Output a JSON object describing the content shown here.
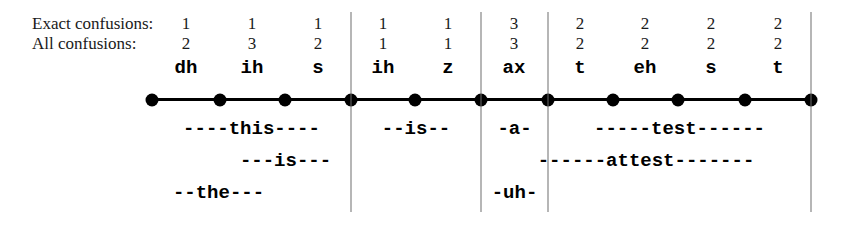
{
  "figure": {
    "kind": "phoneme-alignment-lattice",
    "width": 848,
    "height": 232,
    "background_color": "#ffffff",
    "axis_color": "#000000",
    "divider_color": "#6e6e6e"
  },
  "row_labels": {
    "exact": "Exact confusions:",
    "all": "All confusions:"
  },
  "axis": {
    "node_count": 11,
    "node_positions": [
      152,
      220,
      285,
      351,
      415,
      481,
      548,
      613,
      678,
      745,
      811
    ]
  },
  "dividers": [
    {
      "x": 351,
      "top": 12,
      "bottom": 212
    },
    {
      "x": 481,
      "top": 12,
      "bottom": 212
    },
    {
      "x": 548,
      "top": 12,
      "bottom": 212
    },
    {
      "x": 811,
      "top": 12,
      "bottom": 212
    }
  ],
  "segments": [
    {
      "phoneme": "dh",
      "exact": "1",
      "all": "2",
      "center": 186
    },
    {
      "phoneme": "ih",
      "exact": "1",
      "all": "3",
      "center": 252
    },
    {
      "phoneme": "s",
      "exact": "1",
      "all": "2",
      "center": 318
    },
    {
      "phoneme": "ih",
      "exact": "1",
      "all": "1",
      "center": 383
    },
    {
      "phoneme": "z",
      "exact": "1",
      "all": "1",
      "center": 448
    },
    {
      "phoneme": "ax",
      "exact": "3",
      "all": "3",
      "center": 514
    },
    {
      "phoneme": "t",
      "exact": "2",
      "all": "2",
      "center": 580
    },
    {
      "phoneme": "eh",
      "exact": "2",
      "all": "2",
      "center": 645
    },
    {
      "phoneme": "s",
      "exact": "2",
      "all": "2",
      "center": 711
    },
    {
      "phoneme": "t",
      "exact": "2",
      "all": "2",
      "center": 778
    }
  ],
  "hypothesis_rows": [
    {
      "row_index": 1,
      "spans": [
        {
          "text": "----this----",
          "start": 152,
          "end": 351
        },
        {
          "text": "--is--",
          "start": 351,
          "end": 481
        },
        {
          "text": "-a-",
          "start": 481,
          "end": 548
        },
        {
          "text": "-----test------",
          "start": 548,
          "end": 811
        }
      ]
    },
    {
      "row_index": 2,
      "spans": [
        {
          "text": "---is---",
          "start": 220,
          "end": 351
        },
        {
          "text": "------attest-------",
          "start": 481,
          "end": 811
        }
      ]
    },
    {
      "row_index": 3,
      "spans": [
        {
          "text": "--the---",
          "start": 152,
          "end": 285
        },
        {
          "text": "-uh-",
          "start": 481,
          "end": 548
        }
      ]
    }
  ]
}
